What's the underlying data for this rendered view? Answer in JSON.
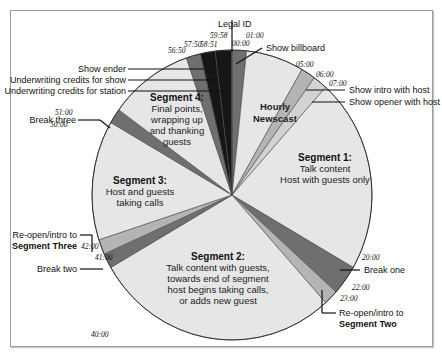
{
  "diagram": {
    "type": "clock-pie",
    "total_minutes": 60,
    "colors": {
      "light": "#e6e6e6",
      "mid": "#b4b4b4",
      "dark": "#6f6f6f",
      "black": "#161616",
      "outline": "#4a4a4a"
    },
    "slices": [
      {
        "name": "Show billboard",
        "start": 0,
        "end": 1,
        "tone": "dark"
      },
      {
        "name": "Hourly Newscast",
        "start": 1,
        "end": 5,
        "tone": "light"
      },
      {
        "name": "Show intro with host",
        "start": 5,
        "end": 6,
        "tone": "mid"
      },
      {
        "name": "Show opener with host",
        "start": 6,
        "end": 7,
        "tone": "light2"
      },
      {
        "name": "Segment 1",
        "start": 7,
        "end": 20,
        "tone": "light"
      },
      {
        "name": "Break one",
        "start": 20,
        "end": 22,
        "tone": "dark"
      },
      {
        "name": "Re-open/intro to Segment Two",
        "start": 22,
        "end": 23,
        "tone": "mid"
      },
      {
        "name": "Segment 2",
        "start": 23,
        "end": 40,
        "tone": "light"
      },
      {
        "name": "Break two",
        "start": 40,
        "end": 41,
        "tone": "dark"
      },
      {
        "name": "Re-open/intro to Segment Three",
        "start": 41,
        "end": 42,
        "tone": "mid"
      },
      {
        "name": "Segment 3",
        "start": 42,
        "end": 50,
        "tone": "light"
      },
      {
        "name": "Break three",
        "start": 50,
        "end": 51,
        "tone": "dark"
      },
      {
        "name": "Segment 4",
        "start": 51,
        "end": 56.833,
        "tone": "light"
      },
      {
        "name": "Show ender",
        "start": 56.833,
        "end": 57.833,
        "tone": "dark"
      },
      {
        "name": "Underwriting credits for show",
        "start": 57.833,
        "end": 58.85,
        "tone": "black"
      },
      {
        "name": "Underwriting credits for station",
        "start": 58.85,
        "end": 59.967,
        "tone": "black"
      },
      {
        "name": "Legal ID",
        "start": 59.967,
        "end": 60,
        "tone": "black"
      }
    ],
    "ticks": {
      "t0000": "00:00",
      "t0100": "01:00",
      "t0500": "05:00",
      "t0600": "06:00",
      "t0700": "07:00",
      "t2000": "20:00",
      "t2200": "22:00",
      "t2300": "23:00",
      "t4000": "40:00",
      "t4100": "41:00",
      "t4200": "42:00",
      "t5000": "50:00",
      "t5100": "51:00",
      "t5650": "56:50",
      "t5750": "57:50",
      "t5851": "58:51",
      "t5958": "59:58"
    },
    "callouts": {
      "legal_id": "Legal ID",
      "show_billboard": "Show billboard",
      "show_intro": "Show intro with host",
      "show_opener": "Show opener with host",
      "show_ender": "Show ender",
      "uw_show": "Underwriting credits for show",
      "uw_station": "Underwriting credits for station",
      "break_three": "Break three",
      "break_two": "Break two",
      "break_one": "Break one",
      "reopen_three_line1": "Re-open/intro to",
      "reopen_three_line2": "Segment Three",
      "reopen_two_line1": "Re-open/intro to",
      "reopen_two_line2": "Segment Two"
    },
    "segments": {
      "newscast": {
        "line1": "Hourly",
        "line2": "Newscast"
      },
      "seg1": {
        "title": "Segment 1:",
        "line1": "Talk content",
        "line2": "Host with guests only"
      },
      "seg2": {
        "title": "Segment 2:",
        "line1": "Talk content with guests,",
        "line2": "towards end of segment",
        "line3": "host begins taking calls,",
        "line4": "or adds new guest"
      },
      "seg3": {
        "title": "Segment 3:",
        "line1": "Host and guests",
        "line2": "taking calls"
      },
      "seg4": {
        "title": "Segment 4:",
        "line1": "Final points,",
        "line2": "wrapping up",
        "line3": "and thanking",
        "line4": "guests"
      }
    }
  }
}
